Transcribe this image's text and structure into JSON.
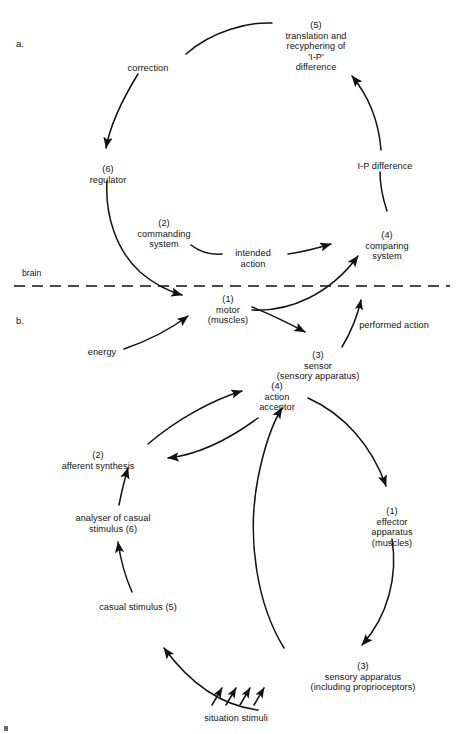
{
  "figure": {
    "panel_a": {
      "tag": "a.",
      "divider_label": "brain",
      "nodes": [
        {
          "id": "translation",
          "text": "(5)\ntranslation and\nrecyphering of\n'I-P'\ndifference",
          "x": 316,
          "y": 20
        },
        {
          "id": "correction",
          "text": "correction",
          "x": 148,
          "y": 63
        },
        {
          "id": "regulator",
          "text": "(6)\nregulator",
          "x": 108,
          "y": 164
        },
        {
          "id": "ip-difference",
          "text": "I-P difference",
          "x": 385,
          "y": 161
        },
        {
          "id": "commanding",
          "text": "(2)\ncommanding\nsystem",
          "x": 164,
          "y": 218
        },
        {
          "id": "intended",
          "text": "intended\naction",
          "x": 253,
          "y": 248
        },
        {
          "id": "comparing",
          "text": "(4)\ncomparing\nsystem",
          "x": 387,
          "y": 230
        },
        {
          "id": "motor",
          "text": "(1)\nmotor\n(muscles)",
          "x": 228,
          "y": 300
        },
        {
          "id": "energy",
          "text": "energy",
          "x": 102,
          "y": 347
        },
        {
          "id": "sensor",
          "text": "(3)\nsensor\n(sensory apparatus)",
          "x": 318,
          "y": 344
        },
        {
          "id": "performed",
          "text": "performed action",
          "x": 394,
          "y": 320
        }
      ]
    },
    "panel_b": {
      "tag": "b.",
      "nodes": [
        {
          "id": "action-acceptor",
          "text": "(4)\naction\nacceptor",
          "x": 277,
          "y": 385
        },
        {
          "id": "afferent",
          "text": "(2)\nafferent synthesis",
          "x": 98,
          "y": 450
        },
        {
          "id": "analyser",
          "text": "analyser of casual\nstimulus (6)",
          "x": 113,
          "y": 517
        },
        {
          "id": "casual-stimulus",
          "text": "casual stimulus (5)",
          "x": 138,
          "y": 604
        },
        {
          "id": "effector",
          "text": "(1)\neffector\napparatus\n(muscles)",
          "x": 392,
          "y": 509
        },
        {
          "id": "sensory-apparatus",
          "text": "(3)\nsensory apparatus\n(including proprioceptors)",
          "x": 363,
          "y": 666
        },
        {
          "id": "situation-stimuli",
          "text": "situation stimuli",
          "x": 236,
          "y": 713
        }
      ]
    },
    "colors": {
      "ink": "#141414",
      "stroke": "#111111",
      "background": "#ffffff"
    }
  }
}
